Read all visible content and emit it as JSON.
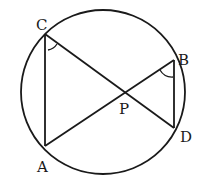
{
  "diagram": {
    "type": "circle-geometry",
    "circle": {
      "cx": 103,
      "cy": 92,
      "r": 82
    },
    "points": {
      "A": {
        "label": "A",
        "x": 45,
        "y": 146,
        "lx": 36,
        "ly": 172
      },
      "B": {
        "label": "B",
        "x": 174,
        "y": 60,
        "lx": 178,
        "ly": 65
      },
      "C": {
        "label": "C",
        "x": 45,
        "y": 34,
        "lx": 36,
        "ly": 30
      },
      "D": {
        "label": "D",
        "x": 174,
        "y": 128,
        "lx": 180,
        "ly": 142
      },
      "P": {
        "label": "P",
        "x": 124,
        "y": 92,
        "lx": 119,
        "ly": 113
      }
    },
    "segments": [
      "CA",
      "CD",
      "AB",
      "BD"
    ],
    "angle_marks": [
      "angle-ACD at C",
      "angle-ABD at B"
    ],
    "colors": {
      "stroke": "#1a1a1a",
      "background": "#ffffff"
    }
  }
}
